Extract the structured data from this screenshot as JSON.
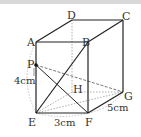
{
  "figure": {
    "type": "cuboid",
    "vertices": {
      "A": [
        36,
        42
      ],
      "B": [
        88,
        42
      ],
      "C": [
        123,
        20
      ],
      "D": [
        72,
        20
      ],
      "E": [
        36,
        113
      ],
      "F": [
        88,
        113
      ],
      "G": [
        123,
        92
      ],
      "H": [
        72,
        92
      ],
      "P": [
        36,
        65
      ]
    },
    "labels": {
      "A": "A",
      "B": "B",
      "C": "C",
      "D": "D",
      "E": "E",
      "F": "F",
      "G": "G",
      "H": "H",
      "P": "P"
    },
    "dimensions": {
      "EP": "4cm",
      "EF": "3cm",
      "FG": "5cm"
    },
    "colors": {
      "edge": "#222222",
      "hidden": "#999999",
      "arc": "#aaaaaa"
    }
  }
}
